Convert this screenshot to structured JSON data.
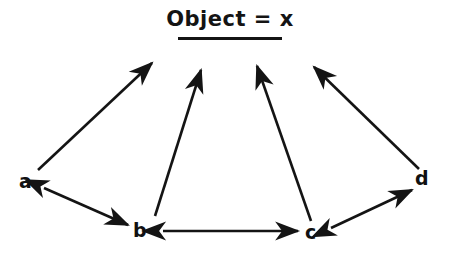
{
  "figure": {
    "background_color": "#ffffff",
    "ink_color": "#141414",
    "width": 450,
    "height": 257
  },
  "title": {
    "text": "Object = x",
    "underlined": true
  },
  "nodes": [
    {
      "id": "a",
      "label": "a",
      "x": 25,
      "y": 175
    },
    {
      "id": "b",
      "label": "b",
      "x": 139,
      "y": 224
    },
    {
      "id": "c",
      "label": "c",
      "x": 310,
      "y": 226
    },
    {
      "id": "d",
      "label": "d",
      "x": 420,
      "y": 172
    }
  ],
  "edges": [
    {
      "id": "a-to-object",
      "from": "a",
      "to": "object",
      "arrows": "single",
      "direction": "up-right"
    },
    {
      "id": "b-to-object",
      "from": "b",
      "to": "object",
      "arrows": "single",
      "direction": "up-right"
    },
    {
      "id": "c-to-object",
      "from": "c",
      "to": "object",
      "arrows": "single",
      "direction": "up-left"
    },
    {
      "id": "d-to-object",
      "from": "d",
      "to": "object",
      "arrows": "single",
      "direction": "up-left"
    },
    {
      "id": "a-b",
      "from": "a",
      "to": "b",
      "arrows": "double",
      "direction": "diagonal"
    },
    {
      "id": "b-c",
      "from": "b",
      "to": "c",
      "arrows": "double",
      "direction": "horizontal"
    },
    {
      "id": "c-d",
      "from": "c",
      "to": "d",
      "arrows": "double",
      "direction": "diagonal"
    }
  ]
}
